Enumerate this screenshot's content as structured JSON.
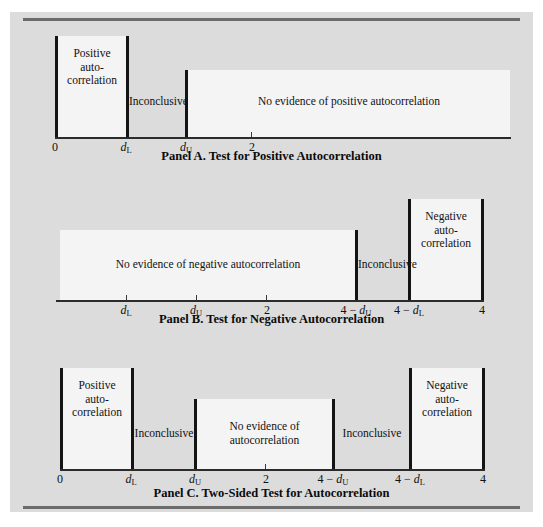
{
  "figure": {
    "background_color": "#dcdcdc",
    "region_fill_color": "#f4f4f4",
    "bar_color": "#141414",
    "axis_color": "#2b2b2b"
  },
  "panels": [
    {
      "id": "panel-a",
      "caption": "Panel A.  Test for Positive Autocorrelation",
      "regions": [
        {
          "label": "Positive\nauto-\ncorrelation",
          "filled": true,
          "from": "0",
          "to": "dL"
        },
        {
          "label": "Inconclusive",
          "filled": false,
          "from": "dL",
          "to": "dU"
        },
        {
          "label": "No evidence of positive autocorrelation",
          "filled": true,
          "from": "dU",
          "to": "4"
        }
      ],
      "axis_labels": [
        {
          "text": "0",
          "sub": "",
          "italic": false,
          "tick": false
        },
        {
          "text": "d",
          "sub": "L",
          "italic": true,
          "tick": false
        },
        {
          "text": "d",
          "sub": "U",
          "italic": true,
          "tick": false
        },
        {
          "text": "2",
          "sub": "",
          "italic": false,
          "tick": true
        }
      ]
    },
    {
      "id": "panel-b",
      "caption": "Panel B.  Test for Negative Autocorrelation",
      "regions": [
        {
          "label": "No evidence of negative autocorrelation",
          "filled": true,
          "from": "0",
          "to": "4-dU"
        },
        {
          "label": "Inconclusive",
          "filled": false,
          "from": "4-dU",
          "to": "4-dL"
        },
        {
          "label": "Negative\nauto-\ncorrelation",
          "filled": true,
          "from": "4-dL",
          "to": "4"
        }
      ],
      "axis_labels": [
        {
          "text": "d",
          "sub": "L",
          "italic": true,
          "tick": true
        },
        {
          "text": "d",
          "sub": "U",
          "italic": true,
          "tick": true
        },
        {
          "text": "2",
          "sub": "",
          "italic": false,
          "tick": true
        },
        {
          "text": "4 − d",
          "sub": "U",
          "italic": true,
          "tick": false
        },
        {
          "text": "4 − d",
          "sub": "L",
          "italic": true,
          "tick": false
        },
        {
          "text": "4",
          "sub": "",
          "italic": false,
          "tick": false
        }
      ]
    },
    {
      "id": "panel-c",
      "caption": "Panel C.  Two-Sided Test for Autocorrelation",
      "regions": [
        {
          "label": "Positive\nauto-\ncorrelation",
          "filled": true,
          "from": "0",
          "to": "dL"
        },
        {
          "label": "Inconclusive",
          "filled": false,
          "from": "dL",
          "to": "dU"
        },
        {
          "label": "No evidence of\nautocorrelation",
          "filled": true,
          "from": "dU",
          "to": "4-dU"
        },
        {
          "label": "Inconclusive",
          "filled": false,
          "from": "4-dU",
          "to": "4-dL"
        },
        {
          "label": "Negative\nauto-\ncorrelation",
          "filled": true,
          "from": "4-dL",
          "to": "4"
        }
      ],
      "axis_labels": [
        {
          "text": "0",
          "sub": "",
          "italic": false,
          "tick": false
        },
        {
          "text": "d",
          "sub": "L",
          "italic": true,
          "tick": false
        },
        {
          "text": "d",
          "sub": "U",
          "italic": true,
          "tick": false
        },
        {
          "text": "2",
          "sub": "",
          "italic": false,
          "tick": true
        },
        {
          "text": "4 − d",
          "sub": "U",
          "italic": true,
          "tick": false
        },
        {
          "text": "4 − d",
          "sub": "L",
          "italic": true,
          "tick": false
        },
        {
          "text": "4",
          "sub": "",
          "italic": false,
          "tick": false
        }
      ]
    }
  ]
}
